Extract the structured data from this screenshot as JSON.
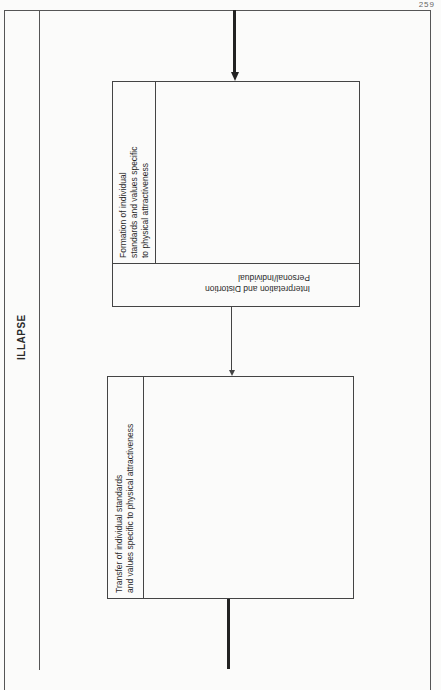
{
  "page": {
    "page_number": "259"
  },
  "diagram": {
    "side_title": "ILLAPSE",
    "box_top": {
      "label_line1": "Formation of individual",
      "label_line2": "standards and values specific",
      "label_line3": "to physical attractiveness",
      "band_line1": "Personal/Individual",
      "band_line2": "Interpretation and Distortion"
    },
    "box_bottom": {
      "label_line1": "Transfer of individual standards",
      "label_line2": "and values specific to physical attractiveness"
    },
    "connectors": [
      {
        "from": "top-entry",
        "to": "box_top",
        "style": "thick-arrow"
      },
      {
        "from": "box_top",
        "to": "box_bottom",
        "style": "thin-arrow"
      },
      {
        "from": "box_bottom",
        "to": "bottom-exit",
        "style": "thick-line"
      }
    ]
  }
}
